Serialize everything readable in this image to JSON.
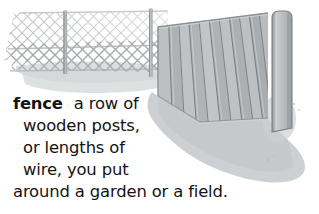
{
  "entry": {
    "headword": "fence",
    "definition_lines": [
      "a row of",
      "wooden posts,",
      "or lengths of",
      "wire, you put",
      "around a garden or a field."
    ],
    "definition_full": "fence  a row of wooden posts, or lengths of wire, you put around a garden or a field."
  },
  "illustration": {
    "title": "fence-illustration",
    "description": "A chain-link wire fence on the left joining a tall wooden plank fence on the right, with grey ground shadow beneath.",
    "parts": [
      "chain-link-mesh",
      "chain-link-post-left",
      "chain-link-post-right",
      "wooden-plank-fence",
      "wooden-corner-post",
      "ground-shadow"
    ]
  },
  "colors": {
    "background": "#ffffff",
    "text": "#141414",
    "mesh_line": "#b9bcbd",
    "mesh_line_dark": "#9a9ea0",
    "plank_light": "#c3c6c7",
    "plank_mid": "#b0b4b6",
    "plank_dark": "#9ea2a4",
    "plank_seam": "#6e7375",
    "post_metal": "#a7abad",
    "ground_shadow": "#c9ccce",
    "ground_shadow_light": "#dcdfe0"
  }
}
